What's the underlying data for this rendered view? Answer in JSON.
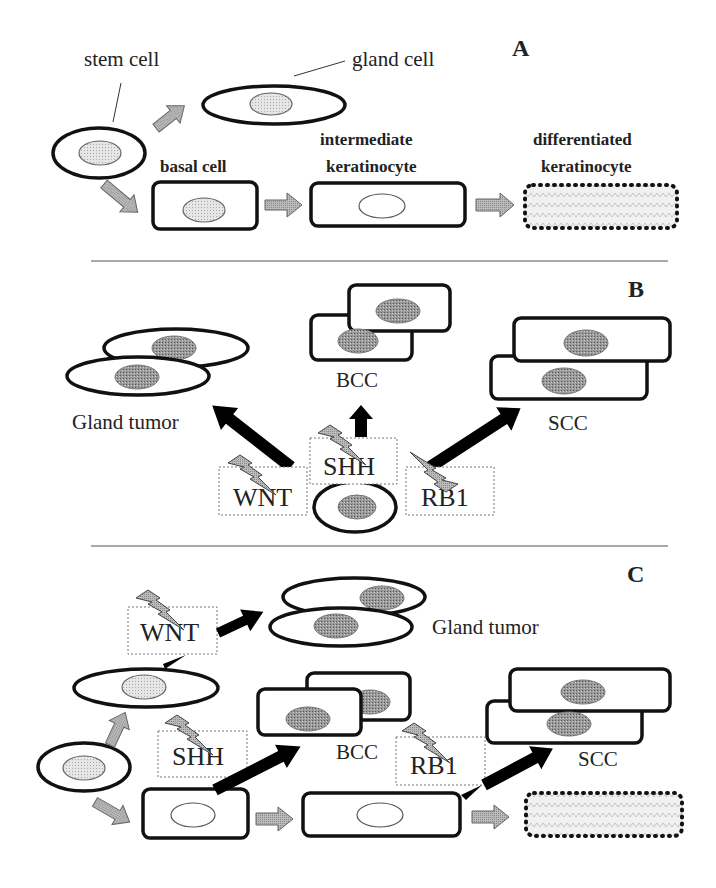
{
  "figure": {
    "panels": {
      "A": {
        "label": "A",
        "stem_cell": "stem cell",
        "gland_cell": "gland cell",
        "basal_cell": "basal cell",
        "intermediate_line1": "intermediate",
        "intermediate_line2": "keratinocyte",
        "differentiated_line1": "differentiated",
        "differentiated_line2": "keratinocyte"
      },
      "B": {
        "label": "B",
        "gland_tumor": "Gland tumor",
        "bcc": "BCC",
        "scc": "SCC",
        "wnt": "WNT",
        "shh": "SHH",
        "rb1": "RB1"
      },
      "C": {
        "label": "C",
        "gland_tumor": "Gland tumor",
        "bcc": "BCC",
        "scc": "SCC",
        "wnt": "WNT",
        "shh": "SHH",
        "rb1": "RB1"
      }
    }
  }
}
